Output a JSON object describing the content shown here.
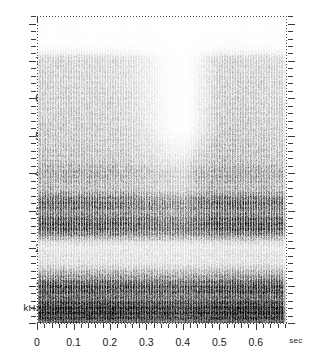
{
  "figure": {
    "kind": "spectrogram",
    "bg_color": "#ffffff",
    "ink_color": "#1a1a1a"
  },
  "axes": {
    "y_unit_label": "kHz",
    "y_tick_labels": [
      "7",
      "6",
      "5",
      "4",
      "3",
      "2",
      "1"
    ],
    "y_tick_values": [
      7,
      6,
      5,
      4,
      3,
      2,
      1
    ],
    "x_unit_label": "sec",
    "x_tick_labels": [
      "0",
      "0.1",
      "0.2",
      "0.3",
      "0.4",
      "0.5",
      "0.6"
    ],
    "x_tick_values": [
      0,
      0.1,
      0.2,
      0.3,
      0.4,
      0.5,
      0.6
    ]
  },
  "chart_data": {
    "type": "heatmap",
    "title": "",
    "subtitle": "",
    "xlabel": "sec",
    "ylabel": "kHz",
    "xlim": [
      0,
      0.683
    ],
    "ylim": [
      0,
      8.2
    ],
    "grid": false,
    "legend": "none",
    "colormap": "grayscale-inverted",
    "x_ticks": [
      0,
      0.1,
      0.2,
      0.3,
      0.4,
      0.5,
      0.6
    ],
    "x_tick_labels": [
      "0",
      "0.1",
      "0.2",
      "0.3",
      "0.4",
      "0.5",
      "0.6"
    ],
    "y_ticks": [
      1,
      2,
      3,
      4,
      5,
      6,
      7
    ],
    "y_tick_labels": [
      "1",
      "2",
      "3",
      "4",
      "5",
      "6",
      "7"
    ],
    "x_minor_tick_step": 0.02,
    "y_minor_tick_step": 0.2,
    "signal": {
      "voicing_striations": true,
      "fundamental_f0_hz": 140,
      "glottal_pulse_period_sec": 0.00714,
      "energy_upper_cutoff_khz": 7.1,
      "voiced_interval_sec": [
        0.0,
        0.675
      ]
    },
    "formant_bands": [
      {
        "name": "F0/low-band",
        "center_khz": 0.35,
        "bandwidth_khz": 0.7,
        "darkness": 0.97
      },
      {
        "name": "F1",
        "center_khz": 0.95,
        "bandwidth_khz": 0.55,
        "darkness": 0.9
      },
      {
        "name": "F2",
        "center_khz": 2.6,
        "bandwidth_khz": 0.7,
        "darkness": 0.93
      },
      {
        "name": "F3",
        "center_khz": 3.2,
        "bandwidth_khz": 0.5,
        "darkness": 0.85
      },
      {
        "name": "F4",
        "center_khz": 4.0,
        "bandwidth_khz": 0.7,
        "darkness": 0.55
      }
    ],
    "antiresonance_bands": [
      {
        "name": "valley-1.6kHz",
        "center_khz": 1.65,
        "bandwidth_khz": 0.35
      },
      {
        "name": "valley-2.05kHz",
        "center_khz": 2.05,
        "bandwidth_khz": 0.3
      }
    ],
    "high_frequency_valley": {
      "description": "reduced 4.5-7 kHz energy",
      "time_range_sec": [
        0.3,
        0.45
      ],
      "freq_range_khz": [
        4.3,
        7.0
      ],
      "min_at_sec": 0.395
    },
    "time_slices": [
      {
        "t": 0.0,
        "high_energy": 0.72,
        "low_energy": 0.95
      },
      {
        "t": 0.05,
        "high_energy": 0.7,
        "low_energy": 0.96
      },
      {
        "t": 0.1,
        "high_energy": 0.68,
        "low_energy": 0.95
      },
      {
        "t": 0.15,
        "high_energy": 0.66,
        "low_energy": 0.94
      },
      {
        "t": 0.2,
        "high_energy": 0.62,
        "low_energy": 0.94
      },
      {
        "t": 0.25,
        "high_energy": 0.52,
        "low_energy": 0.92
      },
      {
        "t": 0.3,
        "high_energy": 0.34,
        "low_energy": 0.9
      },
      {
        "t": 0.35,
        "high_energy": 0.16,
        "low_energy": 0.88
      },
      {
        "t": 0.4,
        "high_energy": 0.1,
        "low_energy": 0.86
      },
      {
        "t": 0.45,
        "high_energy": 0.55,
        "low_energy": 0.9
      },
      {
        "t": 0.5,
        "high_energy": 0.78,
        "low_energy": 0.95
      },
      {
        "t": 0.55,
        "high_energy": 0.74,
        "low_energy": 0.96
      },
      {
        "t": 0.6,
        "high_energy": 0.7,
        "low_energy": 0.96
      },
      {
        "t": 0.65,
        "high_energy": 0.62,
        "low_energy": 0.94
      }
    ]
  }
}
